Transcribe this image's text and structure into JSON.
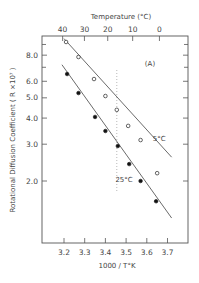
{
  "chart_data": {
    "type": "scatter",
    "title": "",
    "panel_label": "(A)",
    "xlabel": "1000 / T°K",
    "ylabel": "Rotational Diffusion Coefficient ( R ×10⁷ )",
    "top_axis_label": "Temperature  (°C)",
    "xlim": [
      3.09,
      3.8
    ],
    "ylim": [
      1.2,
      10.0
    ],
    "yscale": "log",
    "grid": false,
    "x_ticks": [
      3.2,
      3.3,
      3.4,
      3.5,
      3.6,
      3.7
    ],
    "x_tick_labels": [
      "3.2",
      "3.3",
      "3.4",
      "3.5",
      "3.6",
      "3.7"
    ],
    "y_ticks": [
      2.0,
      3.0,
      4.0,
      5.0,
      6.0,
      8.0
    ],
    "y_tick_labels": [
      "2.0",
      "3.0",
      "4.0",
      "5.0",
      "6.0",
      "8.0"
    ],
    "y_minor_ticks": [
      7.0,
      9.0
    ],
    "top_ticks": [
      40,
      30,
      20,
      10,
      0
    ],
    "top_tick_labels": [
      "40",
      "30",
      "20",
      "10",
      "0"
    ],
    "reference_line": {
      "x": 3.455,
      "style": "dotted",
      "orientation": "vertical"
    },
    "series": [
      {
        "name": "5°C",
        "marker": "open-circle",
        "x": [
          3.21,
          3.27,
          3.345,
          3.4,
          3.455,
          3.51,
          3.57,
          3.65
        ],
        "y": [
          9.25,
          7.84,
          6.15,
          5.1,
          4.38,
          3.67,
          3.14,
          2.18
        ],
        "fit_line": {
          "x": [
            3.2,
            3.72
          ],
          "y": [
            9.6,
            2.6
          ]
        }
      },
      {
        "name": "25°C",
        "marker": "filled-circle",
        "x": [
          3.215,
          3.27,
          3.35,
          3.4,
          3.46,
          3.515,
          3.57,
          3.645
        ],
        "y": [
          6.5,
          5.27,
          4.05,
          3.47,
          2.94,
          2.41,
          2.0,
          1.6
        ],
        "fit_line": {
          "x": [
            3.19,
            3.72
          ],
          "y": [
            7.2,
            1.33
          ]
        }
      }
    ],
    "annotations": [
      {
        "text": "5°C",
        "x": 3.66,
        "y": 3.1
      },
      {
        "text": "25°C",
        "x": 3.49,
        "y": 1.97
      }
    ]
  }
}
